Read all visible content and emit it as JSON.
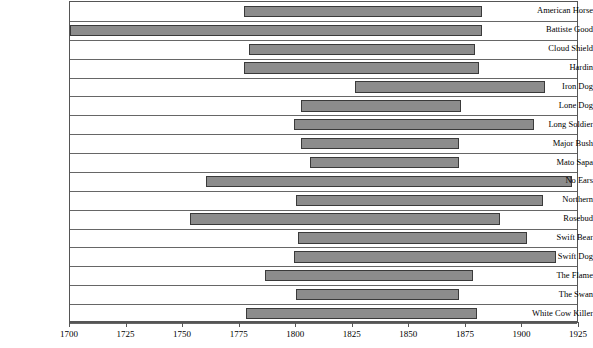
{
  "chart_data": {
    "type": "bar",
    "orientation": "horizontal-range",
    "title": "",
    "subtitle": "",
    "xlabel": "",
    "ylabel": "",
    "xlim": [
      1700,
      1925
    ],
    "xticks": [
      1700,
      1725,
      1750,
      1775,
      1800,
      1825,
      1850,
      1875,
      1900,
      1925
    ],
    "xticklabels": [
      "1700",
      "1725",
      "1750",
      "1775",
      "1800",
      "1825",
      "1850",
      "1875",
      "1900",
      "1925"
    ],
    "grid": true,
    "legend": null,
    "bar_color": "#8c8c8c",
    "bar_edge_color": "#3a3a3a",
    "categories": [
      "American Horse",
      "Battiste Good",
      "Cloud Shield",
      "Hardin",
      "Iron Dog",
      "Lone Dog",
      "Long Soldier",
      "Major Bush",
      "Mato Sapa",
      "No Ears",
      "Northern",
      "Rosebud",
      "Swift Bear",
      "Swift Dog",
      "The Flame",
      "The Swan",
      "White Cow Killer"
    ],
    "ranges": [
      {
        "label": "American Horse",
        "start": 1777,
        "end": 1882
      },
      {
        "label": "Battiste Good",
        "start": 1700,
        "end": 1882
      },
      {
        "label": "Cloud Shield",
        "start": 1779,
        "end": 1879
      },
      {
        "label": "Hardin",
        "start": 1777,
        "end": 1881
      },
      {
        "label": "Iron Dog",
        "start": 1826,
        "end": 1910
      },
      {
        "label": "Lone Dog",
        "start": 1802,
        "end": 1873
      },
      {
        "label": "Long Soldier",
        "start": 1799,
        "end": 1905
      },
      {
        "label": "Major Bush",
        "start": 1802,
        "end": 1872
      },
      {
        "label": "Mato Sapa",
        "start": 1806,
        "end": 1872
      },
      {
        "label": "No Ears",
        "start": 1760,
        "end": 1922
      },
      {
        "label": "Northern",
        "start": 1800,
        "end": 1909
      },
      {
        "label": "Rosebud",
        "start": 1753,
        "end": 1890
      },
      {
        "label": "Swift Bear",
        "start": 1801,
        "end": 1902
      },
      {
        "label": "Swift Dog",
        "start": 1799,
        "end": 1915
      },
      {
        "label": "The Flame",
        "start": 1786,
        "end": 1878
      },
      {
        "label": "The Swan",
        "start": 1800,
        "end": 1872
      },
      {
        "label": "White Cow Killer",
        "start": 1778,
        "end": 1880
      }
    ]
  }
}
